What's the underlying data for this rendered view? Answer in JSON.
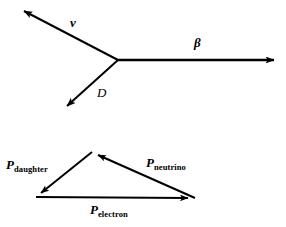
{
  "figure": {
    "background_color": "#ffffff",
    "stroke_color": "#000000",
    "width": 286,
    "height": 227
  },
  "upper_diagram": {
    "name": "decay-vertex-diagram",
    "description": "Three vectors emanating from a common vertex",
    "vertex": {
      "x": 118,
      "y": 60
    },
    "vectors": [
      {
        "id": "neutrino",
        "label": "ν",
        "label_style": "bold-italic",
        "from": {
          "x": 118,
          "y": 60
        },
        "to": {
          "x": 19,
          "y": 8
        },
        "label_pos": {
          "x": 70,
          "y": 16
        }
      },
      {
        "id": "beta",
        "label": "β",
        "label_style": "bold-italic",
        "from": {
          "x": 118,
          "y": 60
        },
        "to": {
          "x": 281,
          "y": 60
        },
        "label_pos": {
          "x": 194,
          "y": 36
        }
      },
      {
        "id": "daughter",
        "label": "D",
        "label_style": "italic",
        "from": {
          "x": 118,
          "y": 60
        },
        "to": {
          "x": 62,
          "y": 111
        },
        "label_pos": {
          "x": 97,
          "y": 86
        }
      }
    ]
  },
  "lower_diagram": {
    "name": "momentum-triangle",
    "description": "Closed momentum triangle of daughter, neutrino and electron momenta",
    "vertices": {
      "apex": {
        "x": 92,
        "y": 152
      },
      "bottom_left": {
        "x": 36,
        "y": 197
      },
      "bottom_right": {
        "x": 195,
        "y": 198
      }
    },
    "vectors": [
      {
        "id": "p-daughter",
        "symbol": "P",
        "subscript": "daughter",
        "from": {
          "x": 92,
          "y": 152
        },
        "to": {
          "x": 36,
          "y": 197
        },
        "label_pos": {
          "x": 6,
          "y": 158
        }
      },
      {
        "id": "p-neutrino",
        "symbol": "P",
        "subscript": "neutrino",
        "from": {
          "x": 195,
          "y": 198
        },
        "to": {
          "x": 92,
          "y": 152
        },
        "label_pos": {
          "x": 146,
          "y": 156
        }
      },
      {
        "id": "p-electron",
        "symbol": "P",
        "subscript": "electron",
        "from": {
          "x": 36,
          "y": 197
        },
        "to": {
          "x": 195,
          "y": 198
        },
        "label_pos": {
          "x": 90,
          "y": 203
        }
      }
    ]
  }
}
